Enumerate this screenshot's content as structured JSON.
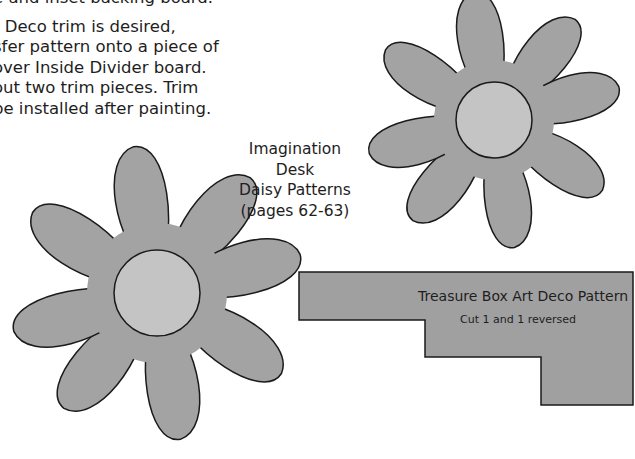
{
  "instructions": {
    "lines": [
      "e and inset backing board.",
      "t Deco trim is desired,",
      "sfer pattern onto a piece of",
      "over  Inside Divider board.",
      "out two trim pieces. Trim",
      "be installed after painting."
    ]
  },
  "caption": {
    "line1": "Imagination Desk",
    "line2": "Daisy Patterns",
    "line3": "(pages 62-63)"
  },
  "deco_pattern": {
    "title": "Treasure Box Art Deco Pattern",
    "subtitle": "Cut 1 and 1 reversed"
  },
  "colors": {
    "petal_fill": "#a3a3a3",
    "center_fill": "#c4c4c4",
    "outline": "#1a1a1a",
    "deco_fill": "#a0a0a0"
  }
}
